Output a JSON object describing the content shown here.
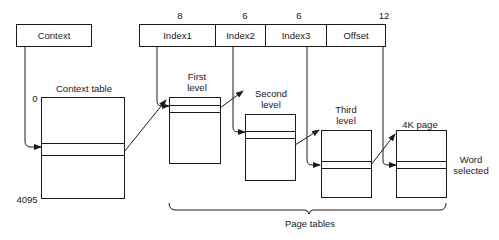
{
  "context_register": {
    "label": "Context"
  },
  "virtual_address": {
    "fields": [
      {
        "label": "Index1",
        "bits": "8"
      },
      {
        "label": "Index2",
        "bits": "6"
      },
      {
        "label": "Index3",
        "bits": "6"
      },
      {
        "label": "Offset",
        "bits": "12"
      }
    ]
  },
  "context_table": {
    "title": "Context table",
    "start_index": "0",
    "end_index": "4095"
  },
  "tables": [
    {
      "title_line1": "First",
      "title_line2": "level"
    },
    {
      "title_line1": "Second",
      "title_line2": "level"
    },
    {
      "title_line1": "Third",
      "title_line2": "level"
    },
    {
      "title_line1": "4K page",
      "title_line2": ""
    }
  ],
  "word_label": {
    "line1": "Word",
    "line2": "selected"
  },
  "bracket_label": "Page tables"
}
